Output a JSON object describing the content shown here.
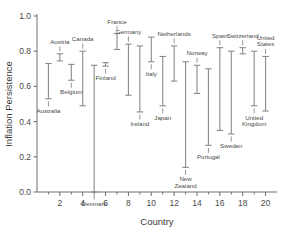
{
  "chart_data": {
    "type": "bar",
    "subtype": "error-bar-range",
    "title": "",
    "xlabel": "Country",
    "ylabel": "Inflation Persistence",
    "xlim": [
      0,
      21
    ],
    "ylim": [
      0.0,
      1.0
    ],
    "grid": false,
    "legend": null,
    "y_ticks": [
      "0.0",
      "0.2",
      "0.4",
      "0.6",
      "0.8",
      "1.0"
    ],
    "y_tick_values": [
      0.0,
      0.2,
      0.4,
      0.6,
      0.8,
      1.0
    ],
    "x_ticks": [
      "2",
      "4",
      "6",
      "8",
      "10",
      "12",
      "14",
      "16",
      "18",
      "20"
    ],
    "x_tick_values": [
      2,
      4,
      6,
      8,
      10,
      12,
      14,
      16,
      18,
      20
    ],
    "categories": [
      "Australia",
      "Austria",
      "Belgium",
      "Canada",
      "Denmark",
      "Finland",
      "France",
      "Germany",
      "Ireland",
      "Italy",
      "Japan",
      "Netherlands",
      "New Zealand",
      "Norway",
      "Portugal",
      "Spain",
      "Sweden",
      "Switzerland",
      "United Kingdom",
      "United States"
    ],
    "points": [
      {
        "x": 1,
        "label": "Australia",
        "low": 0.53,
        "high": 0.73,
        "label_pos": "below"
      },
      {
        "x": 2,
        "label": "Austria",
        "low": 0.745,
        "high": 0.785,
        "label_pos": "above"
      },
      {
        "x": 3,
        "label": "Belgium",
        "low": 0.635,
        "high": 0.725,
        "label_pos": "below"
      },
      {
        "x": 4,
        "label": "Canada",
        "low": 0.49,
        "high": 0.8,
        "label_pos": "above"
      },
      {
        "x": 5,
        "label": "Denmark",
        "low": 0.0,
        "high": 0.72,
        "label_pos": "below"
      },
      {
        "x": 6,
        "label": "Finland",
        "low": 0.715,
        "high": 0.735,
        "label_pos": "below"
      },
      {
        "x": 7,
        "label": "France",
        "low": 0.81,
        "high": 0.9,
        "label_pos": "above"
      },
      {
        "x": 8,
        "label": "Germany",
        "low": 0.55,
        "high": 0.84,
        "label_pos": "above"
      },
      {
        "x": 9,
        "label": "Ireland",
        "low": 0.455,
        "high": 0.83,
        "label_pos": "below"
      },
      {
        "x": 10,
        "label": "Italy",
        "low": 0.74,
        "high": 0.88,
        "label_pos": "below"
      },
      {
        "x": 11,
        "label": "Japan",
        "low": 0.49,
        "high": 0.77,
        "label_pos": "below"
      },
      {
        "x": 12,
        "label": "Netherlands",
        "low": 0.63,
        "high": 0.83,
        "label_pos": "above"
      },
      {
        "x": 13,
        "label": "New Zealand",
        "low": 0.14,
        "high": 0.74,
        "label_pos": "below"
      },
      {
        "x": 14,
        "label": "Norway",
        "low": 0.56,
        "high": 0.72,
        "label_pos": "above"
      },
      {
        "x": 15,
        "label": "Portugal",
        "low": 0.265,
        "high": 0.7,
        "label_pos": "below"
      },
      {
        "x": 16,
        "label": "Spain",
        "low": 0.35,
        "high": 0.82,
        "label_pos": "above"
      },
      {
        "x": 17,
        "label": "Sweden",
        "low": 0.33,
        "high": 0.8,
        "label_pos": "below"
      },
      {
        "x": 18,
        "label": "Switzerland",
        "low": 0.785,
        "high": 0.82,
        "label_pos": "above"
      },
      {
        "x": 19,
        "label": "United Kingdom",
        "low": 0.49,
        "high": 0.8,
        "label_pos": "below"
      },
      {
        "x": 20,
        "label": "United States",
        "low": 0.46,
        "high": 0.77,
        "label_pos": "above"
      }
    ],
    "colors": {
      "axis": "#6e6e6e",
      "bar": "#8a8a8a",
      "text": "#3b3b3b",
      "background": "#ffffff"
    }
  }
}
